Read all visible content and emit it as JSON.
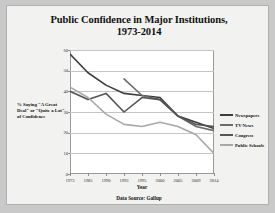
{
  "chart_data": {
    "type": "line",
    "title": "Public Confidence in Major Institutions, 1973-2014",
    "title_line1": "Public Confidence in Major Institutions,",
    "title_line2": "1973-2014",
    "xlabel": "Year",
    "ylabel": "% Saying \"A Great Deal\" or \"Quite a Lot\" of Confidence",
    "source": "Data Source: Gallup",
    "x": [
      1973,
      1985,
      1990,
      1993,
      1995,
      2000,
      2005,
      2009,
      2014
    ],
    "xtick_labels": [
      "1973",
      "1985",
      "1990",
      "1993",
      "1995",
      "2000",
      "2005",
      "2009",
      "2014"
    ],
    "ytick_labels": [
      "0",
      "10",
      "20",
      "30",
      "40",
      "50",
      "60"
    ],
    "ylim": [
      0,
      60
    ],
    "ytick_values": [
      0,
      10,
      20,
      30,
      40,
      50,
      60
    ],
    "grid": true,
    "legend_position": "right",
    "series": [
      {
        "name": "Newspapers",
        "color": "#3d3d3d",
        "values": [
          58,
          49,
          43,
          39,
          38,
          37,
          28,
          25,
          22
        ]
      },
      {
        "name": "TV News",
        "color": "#6b6b6b",
        "values": [
          null,
          null,
          null,
          46,
          38,
          36,
          28,
          23,
          21
        ]
      },
      {
        "name": "Congress",
        "color": "#555555",
        "values": [
          40,
          36,
          39,
          30,
          37,
          36,
          28,
          24,
          23
        ]
      },
      {
        "name": "Public Schools",
        "color": "#a8a8a8",
        "values": [
          42,
          37,
          29,
          24,
          23,
          25,
          23,
          19,
          10
        ]
      }
    ]
  }
}
